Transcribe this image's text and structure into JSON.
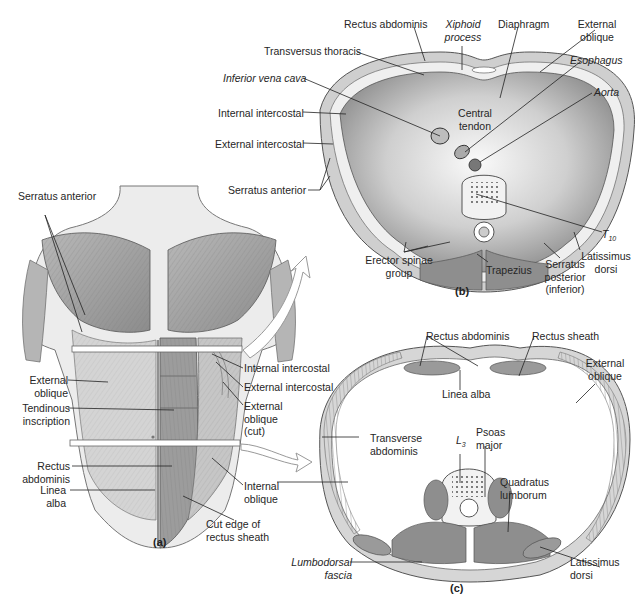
{
  "figure": {
    "panels": [
      {
        "id": "a",
        "label": "(a)",
        "description": "Anterior view of trunk muscles"
      },
      {
        "id": "b",
        "label": "(b)",
        "description": "Transverse section at level of T10 (diaphragm)"
      },
      {
        "id": "c",
        "label": "(c)",
        "description": "Transverse section at level of L3"
      }
    ],
    "panel_a_labels": {
      "serratus_anterior": "Serratus anterior",
      "external_oblique": "External oblique",
      "tendinous_inscription": "Tendinous inscription",
      "rectus_abdominis": "Rectus abdominis",
      "linea_alba": "Linea alba",
      "internal_intercostal": "Internal intercostal",
      "external_intercostal": "External intercostal",
      "external_oblique_cut": "External oblique (cut)",
      "internal_oblique": "Internal oblique",
      "cut_edge_rectus_sheath": "Cut edge of rectus sheath"
    },
    "panel_b_labels": {
      "rectus_abdominis": "Rectus abdominis",
      "xiphoid_process": "Xiphoid process",
      "diaphragm": "Diaphragm",
      "external_oblique": "External oblique",
      "transversus_thoracis": "Transversus thoracis",
      "esophagus": "Esophagus",
      "inferior_vena_cava": "Inferior vena cava",
      "aorta": "Aorta",
      "internal_intercostal": "Internal intercostal",
      "central_tendon": "Central tendon",
      "external_intercostal": "External intercostal",
      "serratus_anterior": "Serratus anterior",
      "t10": "T",
      "t10_sub": "10",
      "erector_spinae_group": "Erector spinae group",
      "trapezius": "Trapezius",
      "serratus_posterior_inferior": "Serratus posterior (inferior)",
      "latissimus_dorsi": "Latissimus dorsi"
    },
    "panel_c_labels": {
      "rectus_abdominis": "Rectus abdominis",
      "rectus_sheath": "Rectus sheath",
      "external_oblique": "External oblique",
      "linea_alba": "Linea alba",
      "transverse_abdominis": "Transverse abdominis",
      "l3": "L",
      "l3_sub": "3",
      "psoas_major": "Psoas major",
      "quadratus_lumborum": "Quadratus lumborum",
      "lumbodorsal_fascia": "Lumbodorsal fascia",
      "latissimus_dorsi": "Latissimus dorsi"
    }
  }
}
